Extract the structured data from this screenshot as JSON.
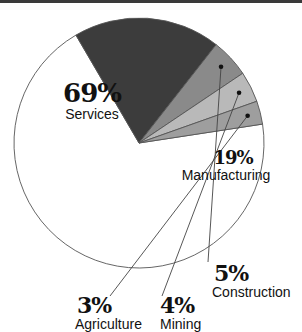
{
  "chart_data": {
    "type": "pie",
    "title": "",
    "categories": [
      "Services",
      "Manufacturing",
      "Construction",
      "Mining",
      "Agriculture"
    ],
    "values": [
      69,
      19,
      5,
      4,
      3
    ],
    "unit": "%",
    "colors": [
      "#ffffff",
      "#3c3c3c",
      "#8a8a8a",
      "#b9b9b9",
      "#9e9e9e"
    ],
    "start_angle_deg": -8.7,
    "direction": "clockwise",
    "legend": "none (direct labels)"
  },
  "labels": {
    "services": {
      "pct": "69%",
      "name": "Services"
    },
    "manufacturing": {
      "pct": "19%",
      "name": "Manufacturing"
    },
    "construction": {
      "pct": "5%",
      "name": "Construction"
    },
    "mining": {
      "pct": "4%",
      "name": "Mining"
    },
    "agriculture": {
      "pct": "3%",
      "name": "Agriculture"
    }
  }
}
